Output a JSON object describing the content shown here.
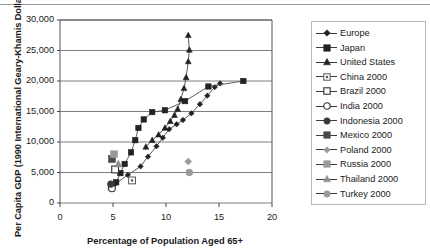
{
  "chart_data": {
    "type": "scatter",
    "title": "",
    "xlabel": "Percentage of Population Aged 65+",
    "ylabel": "Per Capita GDP (1990 International Geary-Khamis Dollars)",
    "xlim": [
      0,
      20
    ],
    "ylim": [
      0,
      30000
    ],
    "xticks": [
      "0",
      "5",
      "10",
      "15",
      "20"
    ],
    "yticks": [
      "0",
      "5,000",
      "10,000",
      "15,000",
      "20,000",
      "25,000",
      "30,000"
    ],
    "grid": "horizontal",
    "legend_position": "right",
    "series": [
      {
        "name": "Europe",
        "marker": "diamond",
        "connected": true,
        "points": [
          [
            5.2,
            3100
          ],
          [
            6.4,
            4600
          ],
          [
            7.6,
            6000
          ],
          [
            8.3,
            7600
          ],
          [
            9.1,
            9300
          ],
          [
            9.7,
            10700
          ],
          [
            10.3,
            12100
          ],
          [
            11.0,
            12900
          ],
          [
            11.6,
            13600
          ],
          [
            12.4,
            14700
          ],
          [
            13.2,
            16200
          ],
          [
            13.9,
            17600
          ],
          [
            14.6,
            19000
          ],
          [
            15.1,
            19600
          ]
        ]
      },
      {
        "name": "Japan",
        "marker": "square",
        "connected": true,
        "points": [
          [
            4.8,
            2600
          ],
          [
            5.3,
            3400
          ],
          [
            5.7,
            4900
          ],
          [
            6.1,
            6400
          ],
          [
            6.7,
            8300
          ],
          [
            7.1,
            10300
          ],
          [
            7.4,
            12300
          ],
          [
            7.9,
            13700
          ],
          [
            8.7,
            14900
          ],
          [
            9.9,
            15200
          ],
          [
            11.8,
            16700
          ],
          [
            14.0,
            19100
          ],
          [
            17.3,
            20000
          ]
        ]
      },
      {
        "name": "United States",
        "marker": "triangle",
        "connected": true,
        "points": [
          [
            8.1,
            9200
          ],
          [
            8.7,
            10300
          ],
          [
            9.3,
            11200
          ],
          [
            9.9,
            12300
          ],
          [
            10.4,
            13400
          ],
          [
            10.8,
            14400
          ],
          [
            11.1,
            15400
          ],
          [
            11.4,
            17000
          ],
          [
            11.7,
            18800
          ],
          [
            11.9,
            20600
          ],
          [
            12.1,
            23200
          ],
          [
            12.2,
            25100
          ],
          [
            12.1,
            27500
          ]
        ]
      }
    ],
    "scatter_points": [
      {
        "name": "China 2000",
        "marker": "square-dot",
        "x": 6.8,
        "y": 3700,
        "color": "#555555"
      },
      {
        "name": "Brazil 2000",
        "marker": "square-open",
        "x": 5.2,
        "y": 5500,
        "color": "#333333"
      },
      {
        "name": "India 2000",
        "marker": "circle-open",
        "x": 4.9,
        "y": 2400,
        "color": "#333333"
      },
      {
        "name": "Indonesia 2000",
        "marker": "circle-filled",
        "x": 4.8,
        "y": 3100,
        "color": "#3a3a3a"
      },
      {
        "name": "Mexico 2000",
        "marker": "square-filled",
        "x": 4.9,
        "y": 7200,
        "color": "#4a4a4a"
      },
      {
        "name": "Poland 2000",
        "marker": "diamond-gray",
        "x": 12.1,
        "y": 6800,
        "color": "#9a9a9a"
      },
      {
        "name": "Russia 2000",
        "marker": "square-gray",
        "x": 5.1,
        "y": 8000,
        "color": "#9a9a9a"
      },
      {
        "name": "Thailand 2000",
        "marker": "triangle-gray",
        "x": 5.5,
        "y": 6400,
        "color": "#8f8f8f"
      },
      {
        "name": "Turkey 2000",
        "marker": "circle-gray",
        "x": 12.2,
        "y": 5000,
        "color": "#9a9a9a"
      }
    ],
    "legend_entries": [
      {
        "label": "Europe",
        "marker": "diamond",
        "line": true
      },
      {
        "label": "Japan",
        "marker": "square",
        "line": true
      },
      {
        "label": "United States",
        "marker": "triangle",
        "line": true
      },
      {
        "label": "China 2000",
        "marker": "square-dot",
        "line": true
      },
      {
        "label": "Brazil 2000",
        "marker": "square-open",
        "line": true
      },
      {
        "label": "India 2000",
        "marker": "circle-open",
        "line": true
      },
      {
        "label": "Indonesia 2000",
        "marker": "circle-filled",
        "line": true
      },
      {
        "label": "Mexico 2000",
        "marker": "square-filled",
        "line": true
      },
      {
        "label": "Poland 2000",
        "marker": "diamond-gray",
        "line": true
      },
      {
        "label": "Russia 2000",
        "marker": "square-gray",
        "line": true
      },
      {
        "label": "Thailand 2000",
        "marker": "triangle-gray",
        "line": true
      },
      {
        "label": "Turkey 2000",
        "marker": "circle-gray",
        "line": true
      }
    ]
  }
}
